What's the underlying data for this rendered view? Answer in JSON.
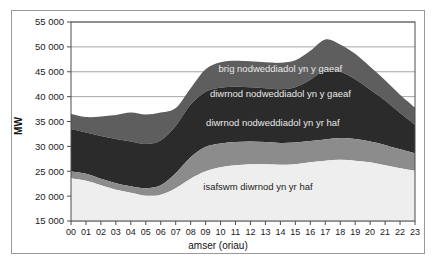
{
  "chart_data": {
    "type": "area",
    "stacked": true,
    "title": "",
    "xlabel": "amser (oriau)",
    "ylabel": "MW",
    "ylim": [
      15000,
      55000
    ],
    "ytick_step": 5000,
    "ytick_labels": [
      "15 000",
      "20 000",
      "25 000",
      "30 000",
      "35 000",
      "40 000",
      "45 000",
      "50 000",
      "55 000"
    ],
    "ytick_values": [
      15000,
      20000,
      25000,
      30000,
      35000,
      40000,
      45000,
      50000,
      55000
    ],
    "grid": true,
    "grid_axis": "y",
    "legend_position": "inline-on-bands",
    "categories": [
      "00",
      "01",
      "02",
      "03",
      "04",
      "05",
      "06",
      "07",
      "08",
      "09",
      "10",
      "11",
      "12",
      "13",
      "14",
      "15",
      "16",
      "17",
      "18",
      "19",
      "20",
      "21",
      "22",
      "23"
    ],
    "xlabel_ticks": [
      "00",
      "01",
      "02",
      "03",
      "04",
      "05",
      "06",
      "07",
      "08",
      "09",
      "10",
      "11",
      "12",
      "13",
      "14",
      "15",
      "16",
      "17",
      "18",
      "19",
      "20",
      "21",
      "22",
      "23"
    ],
    "series": [
      {
        "name": "isafswm diwrnod yn yr haf",
        "label": "isafswm diwrnod yn yr haf",
        "color": "#eeeeee",
        "cumulative_top": [
          23600,
          23100,
          22200,
          21300,
          20700,
          20100,
          20300,
          21600,
          23500,
          25000,
          25800,
          26200,
          26400,
          26400,
          26300,
          26400,
          26800,
          27100,
          27300,
          27100,
          26800,
          26200,
          25600,
          25100
        ],
        "values": [
          8600,
          8100,
          7200,
          6300,
          5700,
          5100,
          5300,
          6600,
          8500,
          10000,
          10800,
          11200,
          11400,
          11400,
          11300,
          11400,
          11800,
          12100,
          12300,
          12100,
          11800,
          11200,
          10600,
          10100
        ]
      },
      {
        "name": "diwrnod nodweddiadol yn yr haf",
        "label": "diwrnod nodweddiadol yn yr haf",
        "color": "#8c8c8c",
        "cumulative_top": [
          25000,
          24500,
          23500,
          22600,
          22000,
          21600,
          22200,
          24600,
          27800,
          29900,
          30600,
          30900,
          31000,
          30900,
          30700,
          30800,
          31100,
          31400,
          31700,
          31500,
          31000,
          30300,
          29400,
          28600
        ],
        "values": [
          1400,
          1400,
          1300,
          1300,
          1300,
          1500,
          1900,
          3000,
          4300,
          4900,
          4800,
          4700,
          4600,
          4500,
          4400,
          4400,
          4300,
          4300,
          4400,
          4400,
          4200,
          4100,
          3800,
          3500
        ]
      },
      {
        "name": "diwrnod nodweddiadol yn y gaeaf",
        "label": "diwrnod nodweddiadol yn y gaeaf",
        "color": "#2b2b2b",
        "cumulative_top": [
          33500,
          32800,
          32100,
          31500,
          31000,
          30500,
          31200,
          34100,
          38400,
          41000,
          41800,
          42000,
          41900,
          41700,
          41500,
          41900,
          43400,
          45400,
          45000,
          43500,
          41400,
          39200,
          36700,
          34300
        ],
        "values": [
          8500,
          8300,
          8600,
          8900,
          9000,
          8900,
          9000,
          9500,
          10600,
          11100,
          11200,
          11100,
          10900,
          10800,
          10800,
          11100,
          12300,
          14000,
          13300,
          12000,
          10400,
          8900,
          7300,
          5700
        ]
      },
      {
        "name": "brig nodweddiadol yn y gaeaf",
        "label": "brig nodweddiadol yn y gaeaf",
        "color": "#5e5e5e",
        "cumulative_top": [
          36500,
          35900,
          36000,
          36300,
          36800,
          36400,
          36800,
          37700,
          41700,
          45500,
          46900,
          47200,
          47100,
          46900,
          46800,
          47300,
          49200,
          51500,
          50500,
          48600,
          46000,
          43300,
          40400,
          37800
        ],
        "values": [
          3000,
          3100,
          3900,
          4800,
          5800,
          5900,
          5600,
          3600,
          3300,
          4500,
          5100,
          5200,
          5200,
          5200,
          5300,
          5400,
          5800,
          6100,
          5500,
          5100,
          4600,
          4100,
          3700,
          3500
        ]
      }
    ],
    "band_labels": [
      {
        "text": "brig nodweddiadol yn y gaeaf",
        "hour": 14.0,
        "value": 45000,
        "tone": "light"
      },
      {
        "text": "diwrnod nodweddiadol yn y gaeaf",
        "hour": 14.0,
        "value": 40000,
        "tone": "light"
      },
      {
        "text": "diwrnod nodweddiadol yn yr haf",
        "hour": 13.5,
        "value": 34000,
        "tone": "light"
      },
      {
        "text": "isafswm diwrnod yn yr haf",
        "hour": 12.5,
        "value": 21300,
        "tone": "dark"
      }
    ]
  }
}
